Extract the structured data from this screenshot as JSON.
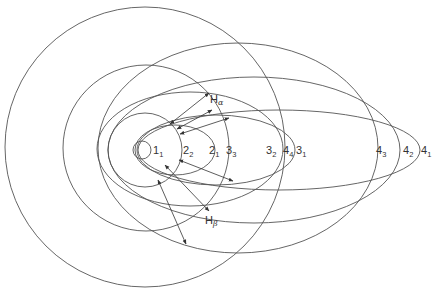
{
  "diagram": {
    "title": "",
    "colors": {
      "stroke": "#555555",
      "arrow": "#333333",
      "text": "#333333",
      "background": "#ffffff"
    },
    "orbits": [
      {
        "id": "1_1",
        "n": "1",
        "k": "1",
        "cx": 142,
        "cy": 150,
        "rx": 9,
        "ry": 9,
        "label_x": 153,
        "label_y": 154
      },
      {
        "id": "2_2",
        "n": "2",
        "k": "2",
        "cx": 145,
        "cy": 150,
        "rx": 37,
        "ry": 37,
        "label_x": 183,
        "label_y": 154
      },
      {
        "id": "2_1",
        "n": "2",
        "k": "1",
        "cx": 175,
        "cy": 150,
        "rx": 40,
        "ry": 25,
        "label_x": 209,
        "label_y": 154
      },
      {
        "id": "3_3",
        "n": "3",
        "k": "3",
        "cx": 146,
        "cy": 148,
        "rx": 83,
        "ry": 83,
        "label_x": 226,
        "label_y": 154
      },
      {
        "id": "3_2",
        "n": "3",
        "k": "2",
        "cx": 190,
        "cy": 149,
        "rx": 93,
        "ry": 57,
        "label_x": 266,
        "label_y": 154
      },
      {
        "id": "3_1",
        "n": "3",
        "k": "1",
        "cx": 216,
        "cy": 150,
        "rx": 79,
        "ry": 35,
        "label_x": 296,
        "label_y": 154
      },
      {
        "id": "4_4",
        "n": "4",
        "k": "4",
        "cx": 145,
        "cy": 147,
        "rx": 140,
        "ry": 140,
        "label_x": 283,
        "label_y": 154
      },
      {
        "id": "4_3",
        "n": "4",
        "k": "3",
        "cx": 238,
        "cy": 148,
        "rx": 140,
        "ry": 105,
        "label_x": 376,
        "label_y": 154
      },
      {
        "id": "4_2",
        "n": "4",
        "k": "2",
        "cx": 254,
        "cy": 150,
        "rx": 146,
        "ry": 73,
        "label_x": 403,
        "label_y": 154
      },
      {
        "id": "4_1",
        "n": "4",
        "k": "1",
        "cx": 279,
        "cy": 150,
        "rx": 141,
        "ry": 40,
        "label_x": 421,
        "label_y": 154
      }
    ],
    "series_labels": [
      {
        "id": "H_alpha",
        "base": "H",
        "greek": "α",
        "x": 210,
        "y": 103
      },
      {
        "id": "H_beta",
        "base": "H",
        "greek": "β",
        "x": 205,
        "y": 224
      }
    ],
    "transitions": [
      {
        "series": "H_alpha",
        "x1": 170,
        "y1": 124,
        "x2": 209,
        "y2": 93
      },
      {
        "series": "H_alpha",
        "x1": 177,
        "y1": 129,
        "x2": 212,
        "y2": 110
      },
      {
        "series": "H_alpha",
        "x1": 180,
        "y1": 134,
        "x2": 229,
        "y2": 118
      },
      {
        "series": "H_beta",
        "x1": 165,
        "y1": 165,
        "x2": 209,
        "y2": 211
      },
      {
        "series": "H_beta",
        "x1": 158,
        "y1": 180,
        "x2": 186,
        "y2": 244
      },
      {
        "series": "H_beta",
        "x1": 179,
        "y1": 160,
        "x2": 233,
        "y2": 181
      }
    ]
  }
}
